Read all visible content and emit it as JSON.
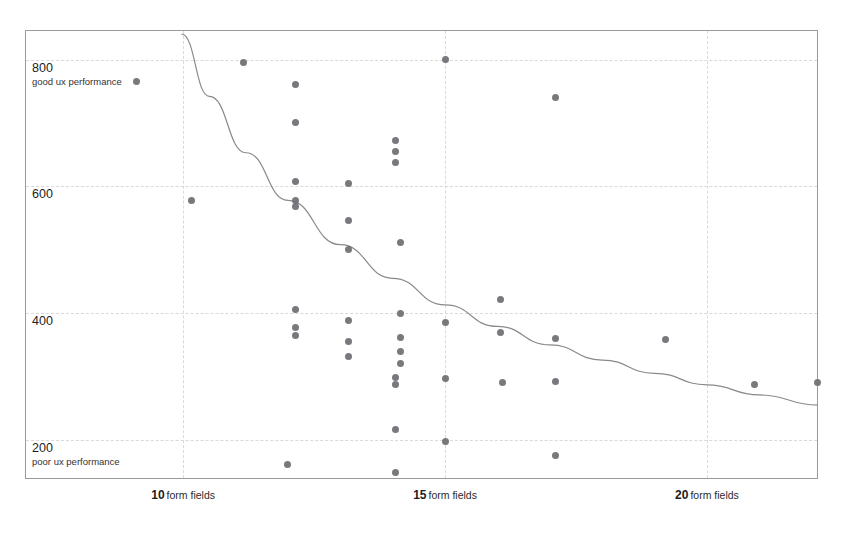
{
  "chart_data": {
    "type": "scatter",
    "title": "Checkout Usability Performance / Number of Form Fields",
    "subtitle": "Top 50 US E-Commerce Sites 2016",
    "credit": "© Baymard.com/checkout-usability",
    "xlabel": "form fields",
    "ylabel": "Checkout Usability Performance",
    "xlim": [
      7,
      22.1
    ],
    "ylim": [
      140,
      845
    ],
    "grid": true,
    "legend": false,
    "x_ticks": [
      {
        "value": 10,
        "num": "10",
        "unit": "form fields"
      },
      {
        "value": 15,
        "num": "15",
        "unit": "form fields"
      },
      {
        "value": 20,
        "num": "20",
        "unit": "form fields"
      }
    ],
    "y_ticks": [
      {
        "value": 800,
        "num": "800",
        "note": "good ux performance"
      },
      {
        "value": 600,
        "num": "600",
        "note": ""
      },
      {
        "value": 400,
        "num": "400",
        "note": ""
      },
      {
        "value": 200,
        "num": "200",
        "note": "poor ux performance"
      }
    ],
    "point_color": "#6e6e72",
    "trend_color": "#8a8a8a",
    "grid_color": "#d9d9d9",
    "border_color": "#9a9a9a",
    "points": [
      {
        "x": 9.1,
        "y": 765
      },
      {
        "x": 11.15,
        "y": 795
      },
      {
        "x": 12.15,
        "y": 760
      },
      {
        "x": 15.0,
        "y": 800
      },
      {
        "x": 17.1,
        "y": 740
      },
      {
        "x": 12.15,
        "y": 700
      },
      {
        "x": 14.05,
        "y": 672
      },
      {
        "x": 14.05,
        "y": 655
      },
      {
        "x": 14.05,
        "y": 637
      },
      {
        "x": 10.15,
        "y": 577
      },
      {
        "x": 12.15,
        "y": 608
      },
      {
        "x": 13.15,
        "y": 605
      },
      {
        "x": 12.15,
        "y": 578
      },
      {
        "x": 12.15,
        "y": 568
      },
      {
        "x": 13.15,
        "y": 546
      },
      {
        "x": 13.15,
        "y": 500
      },
      {
        "x": 14.15,
        "y": 512
      },
      {
        "x": 12.15,
        "y": 405
      },
      {
        "x": 13.15,
        "y": 388
      },
      {
        "x": 14.15,
        "y": 400
      },
      {
        "x": 12.15,
        "y": 377
      },
      {
        "x": 12.15,
        "y": 365
      },
      {
        "x": 13.15,
        "y": 355
      },
      {
        "x": 14.15,
        "y": 362
      },
      {
        "x": 16.05,
        "y": 422
      },
      {
        "x": 15.0,
        "y": 385
      },
      {
        "x": 16.05,
        "y": 370
      },
      {
        "x": 14.15,
        "y": 339
      },
      {
        "x": 14.15,
        "y": 320
      },
      {
        "x": 17.1,
        "y": 360
      },
      {
        "x": 13.15,
        "y": 332
      },
      {
        "x": 19.2,
        "y": 358
      },
      {
        "x": 14.05,
        "y": 298
      },
      {
        "x": 14.05,
        "y": 288
      },
      {
        "x": 15.0,
        "y": 297
      },
      {
        "x": 16.1,
        "y": 290
      },
      {
        "x": 17.1,
        "y": 292
      },
      {
        "x": 22.1,
        "y": 290
      },
      {
        "x": 20.9,
        "y": 288
      },
      {
        "x": 14.05,
        "y": 217
      },
      {
        "x": 15.0,
        "y": 198
      },
      {
        "x": 17.1,
        "y": 175
      },
      {
        "x": 12.0,
        "y": 162
      },
      {
        "x": 14.05,
        "y": 148
      }
    ],
    "trend_line": {
      "description": "declining power-law fit",
      "path_points": [
        {
          "x": 9.97,
          "y": 840
        },
        {
          "x": 10.5,
          "y": 742
        },
        {
          "x": 11.2,
          "y": 653
        },
        {
          "x": 12.0,
          "y": 578
        },
        {
          "x": 13.0,
          "y": 508
        },
        {
          "x": 14.0,
          "y": 455
        },
        {
          "x": 15.0,
          "y": 413
        },
        {
          "x": 16.0,
          "y": 379
        },
        {
          "x": 17.0,
          "y": 350
        },
        {
          "x": 18.0,
          "y": 326
        },
        {
          "x": 19.0,
          "y": 305
        },
        {
          "x": 20.0,
          "y": 287
        },
        {
          "x": 21.0,
          "y": 271
        },
        {
          "x": 22.12,
          "y": 255
        }
      ]
    }
  }
}
